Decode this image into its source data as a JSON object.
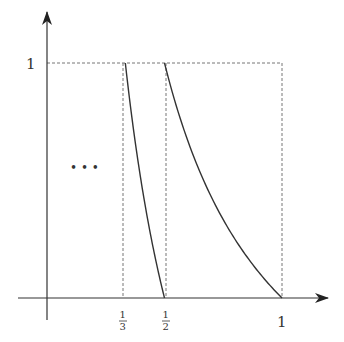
{
  "diagram": {
    "title": "",
    "colors": {
      "axis": "#333333",
      "curve": "#333333",
      "guide": "#777777",
      "background": "#ffffff"
    },
    "axes": {
      "x_ticks": [
        {
          "value": 0.3333,
          "label_num": "1",
          "label_den": "3"
        },
        {
          "value": 0.5,
          "label_num": "1",
          "label_den": "2"
        },
        {
          "value": 1,
          "label": "1"
        }
      ],
      "y_ticks": [
        {
          "value": 1,
          "label": "1"
        }
      ]
    },
    "branches": [
      {
        "name": "branch-n2",
        "domain": [
          0.3333,
          0.5
        ],
        "formula": "1/x - 2"
      },
      {
        "name": "branch-n1",
        "domain": [
          0.5,
          1
        ],
        "formula": "1/x - 1"
      }
    ],
    "ellipsis": "• • •"
  }
}
